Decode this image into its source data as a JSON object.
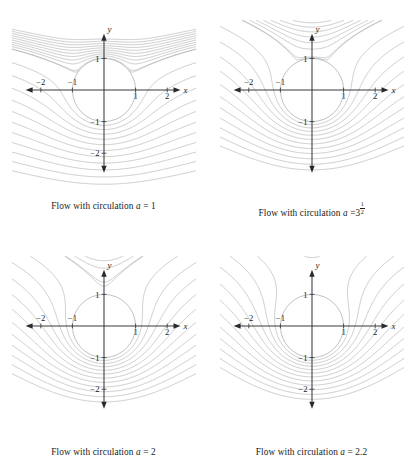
{
  "figure": {
    "name": "flow-past-cylinder-with-circulation",
    "background_color": "#ffffff",
    "width": 415,
    "height": 474
  },
  "style": {
    "streamline_color": "#aaaaaa",
    "separatrix_color": "#2b2b2b",
    "axis_color": "#3a3a3a",
    "cylinder_stroke": "#a6a6a6",
    "text_color": "#1a1a1a"
  },
  "panels": [
    {
      "id": "panel-a1",
      "caption_prefix": "Flow with circulation",
      "caption_var": "a",
      "caption_eq": "=",
      "caption_value": "1",
      "caption_value_type": "plain",
      "a": 1,
      "x_label": "x",
      "y_label": "y",
      "x_ticks": [
        {
          "value": -2,
          "label": "−2"
        },
        {
          "value": -1,
          "label": "−1"
        },
        {
          "value": 1,
          "label": "1"
        },
        {
          "value": 2,
          "label": "2"
        }
      ],
      "y_ticks": [
        {
          "value": 1,
          "label": "1"
        },
        {
          "value": -1,
          "label": "−1"
        },
        {
          "value": -2,
          "label": "−2"
        }
      ],
      "stagnation_description": "two stagnation points on lower circle surface, widely separated"
    },
    {
      "id": "panel-a2",
      "caption_prefix": "Flow with circulation",
      "caption_var": "a",
      "caption_eq": "=",
      "caption_value": "3",
      "caption_value_type": "power",
      "caption_exp_num": "1",
      "caption_exp_den": "2",
      "a": 1.7320508,
      "x_label": "x",
      "y_label": "y",
      "x_ticks": [
        {
          "value": -2,
          "label": "−2"
        },
        {
          "value": -1,
          "label": "−1"
        },
        {
          "value": 1,
          "label": "1"
        },
        {
          "value": 2,
          "label": "2"
        }
      ],
      "y_ticks": [
        {
          "value": 1,
          "label": "1"
        },
        {
          "value": -1,
          "label": "−1"
        }
      ],
      "stagnation_description": "two stagnation points on lower circle surface, closer together"
    },
    {
      "id": "panel-a3",
      "caption_prefix": "Flow with circulation",
      "caption_var": "a",
      "caption_eq": "=",
      "caption_value": "2",
      "caption_value_type": "plain",
      "a": 2,
      "x_label": "x",
      "y_label": "y",
      "x_ticks": [
        {
          "value": -2,
          "label": "−2"
        },
        {
          "value": -1,
          "label": "−1"
        },
        {
          "value": 1,
          "label": "1"
        },
        {
          "value": 2,
          "label": "2"
        }
      ],
      "y_ticks": [
        {
          "value": 1,
          "label": "1"
        },
        {
          "value": -1,
          "label": "−1"
        },
        {
          "value": -2,
          "label": "−2"
        }
      ],
      "stagnation_description": "single stagnation point at bottom of circle (0,-1), cusped separatrix"
    },
    {
      "id": "panel-a4",
      "caption_prefix": "Flow with circulation",
      "caption_var": "a",
      "caption_eq": "=",
      "caption_value": "2.2",
      "caption_value_type": "plain",
      "a": 2.2,
      "x_label": "x",
      "y_label": "y",
      "x_ticks": [
        {
          "value": -2,
          "label": "−2"
        },
        {
          "value": -1,
          "label": "−1"
        },
        {
          "value": 1,
          "label": "1"
        },
        {
          "value": 2,
          "label": "2"
        }
      ],
      "y_ticks": [
        {
          "value": 1,
          "label": "1"
        },
        {
          "value": -1,
          "label": "−1"
        },
        {
          "value": -2,
          "label": "−2"
        }
      ],
      "stagnation_description": "stagnation point detached below circle, closed eddy region"
    }
  ],
  "chart_data": {
    "type": "line",
    "xlabel": "x",
    "ylabel": "y",
    "xlim": [
      -2.5,
      2.5
    ],
    "ylim": [
      -2.6,
      1.9
    ],
    "grid": false,
    "legend": "none",
    "cylinder": {
      "center": [
        0,
        0
      ],
      "radius": 1
    },
    "stream_function": "psi = U*y*(1 - R^2/(x^2+y^2)) - a*ln(sqrt(x^2+y^2)/R)",
    "parameters": {
      "U": 1,
      "R": 1
    },
    "series": [
      {
        "name": "a = 1",
        "a": 1,
        "separatrix_psi": 0
      },
      {
        "name": "a = 3^(1/2)",
        "a": 1.7320508,
        "separatrix_psi": 0
      },
      {
        "name": "a = 2",
        "a": 2,
        "separatrix_psi": 0
      },
      {
        "name": "a = 2.2",
        "a": 2.2,
        "separatrix_psi": 0
      }
    ],
    "xticks": [
      -2,
      -1,
      1,
      2
    ],
    "yticks": [
      -2,
      -1,
      1
    ]
  }
}
